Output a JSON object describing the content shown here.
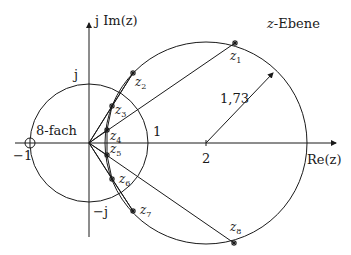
{
  "diagram": {
    "plane_label": "z-Ebene",
    "plane_var": "z",
    "plane_suffix": "-Ebene",
    "axes": {
      "real_label": "Re(z)",
      "imag_label": "j Im(z)"
    },
    "unit_circle": {
      "label_top": "j",
      "label_bottom": "−j",
      "label_right": "1",
      "label_left": "−1"
    },
    "pole": {
      "label": "8-fach",
      "position": "-1"
    },
    "big_circle": {
      "center_label": "2",
      "radius_label": "1,73"
    },
    "zeros": [
      {
        "name": "z",
        "sub": "1"
      },
      {
        "name": "z",
        "sub": "2"
      },
      {
        "name": "z",
        "sub": "3"
      },
      {
        "name": "z",
        "sub": "4"
      },
      {
        "name": "z",
        "sub": "5"
      },
      {
        "name": "z",
        "sub": "6"
      },
      {
        "name": "z",
        "sub": "7"
      },
      {
        "name": "z",
        "sub": "8"
      }
    ],
    "colors": {
      "stroke": "#1a1a1a",
      "background": "#ffffff"
    }
  }
}
